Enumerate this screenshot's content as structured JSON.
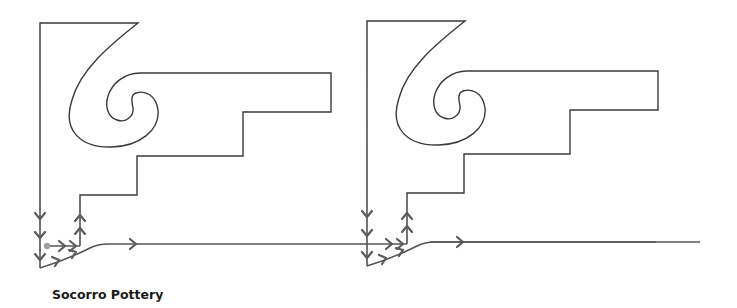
{
  "caption": "Socorro Pottery",
  "colors": {
    "outline": "#3a3a3a",
    "flow": "#555555",
    "start_dot": "#a0a0a0",
    "background": "#ffffff"
  },
  "figures": [
    {
      "name": "motif-1",
      "offset_x": 0,
      "has_start_dot": true
    },
    {
      "name": "motif-2",
      "offset_x": 327,
      "has_start_dot": false
    }
  ],
  "icons": {
    "arrow_down": "down-arrow-icon",
    "arrow_up": "up-arrow-icon",
    "arrow_right": "right-arrow-icon",
    "start_dot": "start-dot-icon"
  }
}
